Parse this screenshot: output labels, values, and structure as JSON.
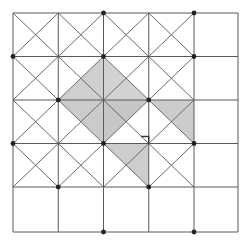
{
  "figure": {
    "type": "geometric-diagram",
    "canvas": {
      "width": 251,
      "height": 245,
      "background": "#ffffff"
    }
  },
  "geometry": {
    "grid": {
      "description": "4 by 4 array of unit squares, each subdivided by both diagonals",
      "columns": 4,
      "rows": 4,
      "x_lines": [
        13,
        58.25,
        103.5,
        148.75,
        194,
        238
      ],
      "y_lines": [
        13,
        56.5,
        100,
        143.5,
        187,
        232
      ],
      "x_min": 13,
      "x_max": 238,
      "y_min": 13,
      "y_max": 232,
      "cell_width": 45,
      "cell_height": 43.7
    },
    "colors": {
      "grid_line": "#5a5a5a",
      "diagonal_line": "#6b6b6b",
      "shade_light": "#d9d9d9",
      "shade_mid": "#c9c9c9",
      "shade_dark": "#bdbdbd",
      "node_dot": "#222222",
      "background": "#ffffff",
      "right_angle_mark": "#3a3a3a"
    },
    "stroke_widths": {
      "grid_line": 1.0,
      "diagonal_line": 1.0,
      "right_angle_mark": 1.4
    },
    "nodes": {
      "description": "Filled dots at alternating lattice vertices (checkerboard parity)",
      "radius": 2.4,
      "points": [
        [
          103.5,
          13
        ],
        [
          194,
          13
        ],
        [
          13,
          56.5
        ],
        [
          103.5,
          56.5
        ],
        [
          194,
          56.5
        ],
        [
          58.25,
          100
        ],
        [
          148.75,
          100
        ],
        [
          13,
          143.5
        ],
        [
          103.5,
          143.5
        ],
        [
          194,
          143.5
        ],
        [
          58.25,
          187
        ],
        [
          148.75,
          187
        ],
        [
          103.5,
          232
        ],
        [
          194,
          232
        ]
      ]
    },
    "shaded_regions": [
      {
        "name": "diamond-upper-left-quadrant-a",
        "fill": "#cfcfcf",
        "points": [
          [
            103.5,
            56.5
          ],
          [
            103.5,
            100
          ],
          [
            58.25,
            100
          ]
        ]
      },
      {
        "name": "diamond-upper-right-quadrant-a",
        "fill": "#d2d2d2",
        "points": [
          [
            103.5,
            56.5
          ],
          [
            148.75,
            100
          ],
          [
            103.5,
            100
          ]
        ]
      },
      {
        "name": "diamond-lower-left-quadrant-a",
        "fill": "#cbcbcb",
        "points": [
          [
            58.25,
            100
          ],
          [
            103.5,
            100
          ],
          [
            103.5,
            143.5
          ]
        ]
      },
      {
        "name": "diamond-lower-right-quadrant-a",
        "fill": "#c6c6c6",
        "points": [
          [
            103.5,
            100
          ],
          [
            148.75,
            100
          ],
          [
            103.5,
            143.5
          ]
        ]
      },
      {
        "name": "right-wing-triangle",
        "fill": "#cccccc",
        "points": [
          [
            148.75,
            100
          ],
          [
            194,
            100
          ],
          [
            194,
            143.5
          ]
        ]
      },
      {
        "name": "bottom-wing-triangle",
        "fill": "#cdcdcd",
        "points": [
          [
            103.5,
            143.5
          ],
          [
            148.75,
            143.5
          ],
          [
            148.75,
            187
          ]
        ]
      }
    ],
    "right_angle_marker": {
      "name": "right-angle-mark",
      "vertex": [
        148.75,
        143.5
      ],
      "size": 7,
      "orientation": "upper-left",
      "points": [
        [
          141.7,
          136.5
        ],
        [
          148.7,
          136.5
        ],
        [
          148.7,
          143.5
        ]
      ]
    }
  }
}
